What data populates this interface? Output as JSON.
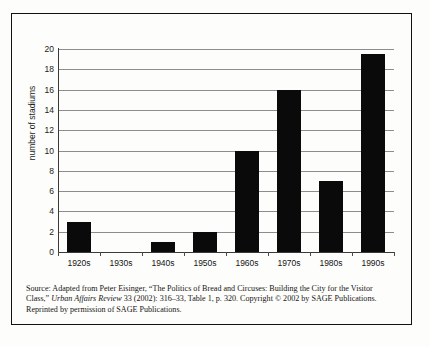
{
  "chart_data": {
    "type": "bar",
    "title": "",
    "xlabel": "",
    "ylabel": "number of stadiums",
    "categories": [
      "1920s",
      "1930s",
      "1940s",
      "1950s",
      "1960s",
      "1970s",
      "1980s",
      "1990s"
    ],
    "values": [
      3,
      0,
      1,
      2,
      10,
      16,
      7,
      19.5
    ],
    "ylim": [
      0,
      20
    ],
    "ytick_labels": [
      "20",
      "18",
      "16",
      "14",
      "12",
      "10",
      "8",
      "6",
      "4",
      "2",
      "0"
    ],
    "ytick_values": [
      20,
      18,
      16,
      14,
      12,
      10,
      8,
      6,
      4,
      2,
      0
    ],
    "grid": true,
    "legend": "none",
    "bar_color": "#0a0a0a",
    "gridline_color": "#8d8d8d",
    "axis_color": "#3a3a3a"
  },
  "caption": {
    "line1_a": "Source: Adapted from Peter Eisinger, “The Politics of Bread and Circuses: Building the City for the Visitor",
    "line2_a": "Class,” ",
    "line2_italic": "Urban Affairs Review",
    "line2_b": " 33 (2002): 316–33, Table 1, p. 320. Copyright © 2002 by SAGE Publications.",
    "line3": "Reprinted by permission of SAGE Publications."
  }
}
